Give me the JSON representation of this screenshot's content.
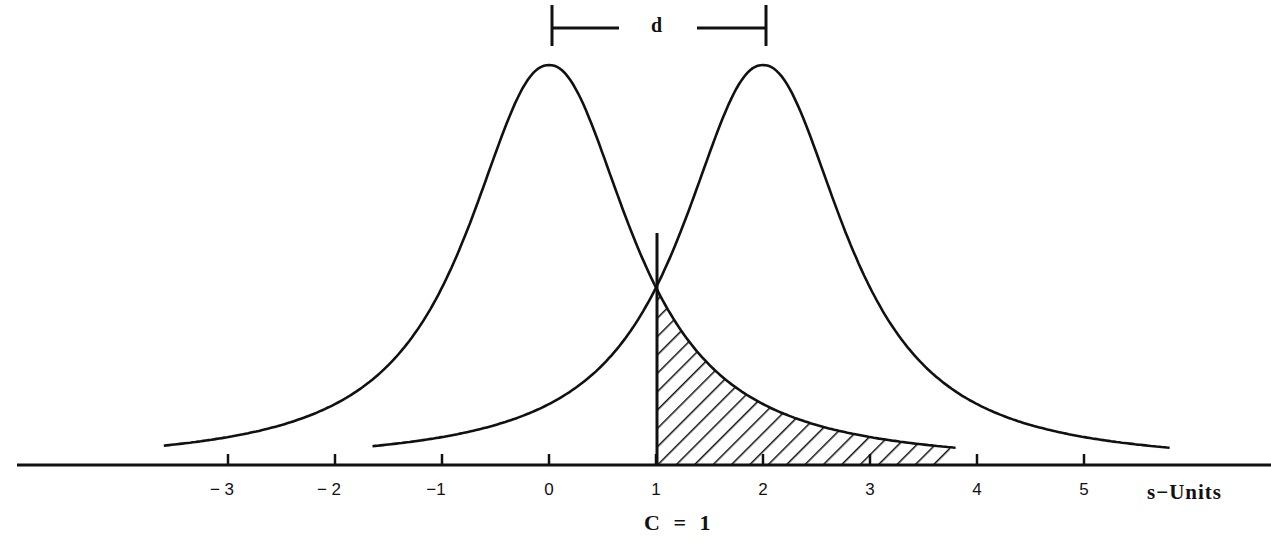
{
  "chart_data": {
    "type": "line",
    "title": "",
    "xlabel": "s-Units",
    "ylabel": "",
    "x_ticks": [
      -3,
      -2,
      -1,
      0,
      1,
      2,
      3,
      4,
      5
    ],
    "x_tick_labels": [
      "− 3",
      "− 2",
      "−1",
      "0",
      "1",
      "2",
      "3",
      "4",
      "5"
    ],
    "xlim": [
      -5,
      6.5
    ],
    "grid": false,
    "legend": "none",
    "series": [
      {
        "name": "noise distribution",
        "mean": 0,
        "x_range": [
          -3.6,
          3.8
        ],
        "peak_height": 1.0
      },
      {
        "name": "signal distribution",
        "mean": 2,
        "x_range": [
          -1.65,
          5.8
        ],
        "peak_height": 1.0
      }
    ],
    "criterion": {
      "label": "C = 1",
      "x": 1
    },
    "separation": {
      "label": "d",
      "from": 0,
      "to": 2
    },
    "shaded_region": {
      "description": "area under noise distribution to the right of criterion (false alarms)",
      "x_from": 1,
      "x_to": 3.75,
      "pattern": "diagonal hatching"
    },
    "annotations": [
      "d",
      "C = 1",
      "s−Units"
    ]
  },
  "labels": {
    "d": "d",
    "criterion": "C  =  1",
    "units": "s−Units",
    "ticks": [
      "− 3",
      "− 2",
      "−1",
      "0",
      "1",
      "2",
      "3",
      "4",
      "5"
    ]
  }
}
